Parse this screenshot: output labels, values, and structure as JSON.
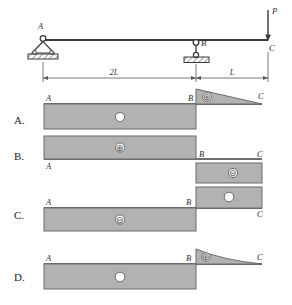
{
  "figure": {
    "type": "beam-shear-diagram-multiple-choice",
    "beam": {
      "labels": {
        "support_a": "A",
        "support_b": "B",
        "free_end_c": "C",
        "load": "P"
      },
      "dimensions": {
        "span_ab": "2L",
        "span_bc": "L"
      },
      "supports": {
        "a_type": "pin-support",
        "b_type": "roller-support"
      },
      "load_direction": "down"
    },
    "colors": {
      "fill": "#b2b2b2",
      "stroke": "#5a5a5a",
      "axis": "#404040",
      "text": "#2a2a2a",
      "background": "#ffffff"
    },
    "options": [
      {
        "letter": "A.",
        "labels": {
          "a": "A",
          "b": "B",
          "c": "C"
        },
        "left_segment": {
          "shape": "rect",
          "side": "below",
          "sign": "○"
        },
        "right_segment": {
          "shape": "triangle",
          "side": "above",
          "sign": "⊕"
        }
      },
      {
        "letter": "B.",
        "labels": {
          "a": "A",
          "b": "B",
          "c": "C"
        },
        "left_segment": {
          "shape": "rect",
          "side": "above",
          "sign": "⊕"
        },
        "right_segment": {
          "shape": "rect",
          "side": "below",
          "sign": "⊖"
        }
      },
      {
        "letter": "C.",
        "labels": {
          "a": "A",
          "b": "B",
          "c": "C"
        },
        "left_segment": {
          "shape": "rect",
          "side": "below",
          "sign": "⊖"
        },
        "right_segment": {
          "shape": "rect",
          "side": "above",
          "sign": "○"
        }
      },
      {
        "letter": "D.",
        "labels": {
          "a": "A",
          "b": "B",
          "c": "C"
        },
        "left_segment": {
          "shape": "rect",
          "side": "below",
          "sign": "○"
        },
        "right_segment": {
          "shape": "curve-concave",
          "side": "above",
          "sign": "⊕"
        }
      }
    ]
  }
}
